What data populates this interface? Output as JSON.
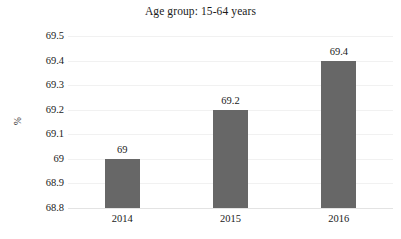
{
  "chart_data": {
    "type": "bar",
    "title": "Age group: 15-64 years",
    "xlabel": "",
    "ylabel": "%",
    "categories": [
      "2014",
      "2015",
      "2016"
    ],
    "values": [
      69,
      69.2,
      69.4
    ],
    "value_labels": [
      "69",
      "69.2",
      "69.4"
    ],
    "ylim": [
      68.8,
      69.5
    ],
    "ytick_labels": [
      "69.5",
      "69.4",
      "69.3",
      "69.2",
      "69.1",
      "69",
      "68.9",
      "68.8"
    ],
    "ytick_values": [
      69.5,
      69.4,
      69.3,
      69.2,
      69.1,
      69,
      68.9,
      68.8
    ],
    "ystep": 0.1,
    "grid": true,
    "grid_axis": "y",
    "legend": null,
    "legend_position": "none",
    "series": [
      {
        "name": "Age group: 15-64 years",
        "values": [
          69,
          69.2,
          69.4
        ],
        "color": "#676767"
      }
    ]
  },
  "colors": {
    "bar": "#676767",
    "gridline": "#f1f1f1",
    "baseline": "#e3e3e3",
    "text": "#1a1a1a",
    "background": "#ffffff"
  }
}
